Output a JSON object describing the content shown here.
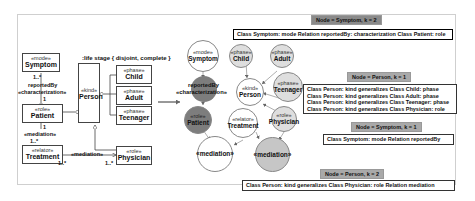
{
  "uml_diagram": {
    "generalization_set_label": ":life stage { disjoint, complete }",
    "classes": [
      {
        "stereotype": "«mode»",
        "name": "Symptom"
      },
      {
        "stereotype": "«role»",
        "name": "Patient"
      },
      {
        "stereotype": "«relator»",
        "name": "Treatment"
      },
      {
        "stereotype": "«kind»",
        "name": "Person"
      },
      {
        "stereotype": "«phase»",
        "name": "Child"
      },
      {
        "stereotype": "«phase»",
        "name": "Adult"
      },
      {
        "stereotype": "«phase»",
        "name": "Teenager"
      },
      {
        "stereotype": "«role»",
        "name": "Physician"
      }
    ],
    "associations": {
      "reported_by": {
        "name": "reportedBy",
        "stereotype": "«characterization»",
        "mult_top": "1..*",
        "mult_bottom": "1"
      },
      "mediation_patient": {
        "stereotype": "«mediation»",
        "mult_top": "1",
        "mult_bottom": "1..*"
      },
      "mediation_physician": {
        "stereotype": "«mediation»",
        "mult_left": "1..*",
        "mult_right": "1..*"
      }
    }
  },
  "graph": {
    "nodes": [
      {
        "id": "symptom",
        "stereotype": "«mode»",
        "name": "Symptom",
        "shade": "white"
      },
      {
        "id": "child",
        "stereotype": "«phase»",
        "name": "Child",
        "shade": "light"
      },
      {
        "id": "adult",
        "stereotype": "«phase»",
        "name": "Adult",
        "shade": "light"
      },
      {
        "id": "person",
        "stereotype": "«kind»",
        "name": "Person",
        "shade": "white"
      },
      {
        "id": "teenager",
        "stereotype": "«phase»",
        "name": "Teenager",
        "shade": "light"
      },
      {
        "id": "reportedby",
        "stereotype": "reportedBy",
        "name": "«characterization»",
        "shade": "dark"
      },
      {
        "id": "patient",
        "stereotype": "«role»",
        "name": "Patient",
        "shade": "dark"
      },
      {
        "id": "treatment",
        "stereotype": "«relator»",
        "name": "Treatment",
        "shade": "white"
      },
      {
        "id": "physician",
        "stereotype": "«role»",
        "name": "Physician",
        "shade": "light"
      },
      {
        "id": "mediation1",
        "stereotype": "",
        "name": "«mediation»",
        "shade": "white"
      },
      {
        "id": "mediation2",
        "stereotype": "",
        "name": "«mediation»",
        "shade": "mid"
      }
    ]
  },
  "panels": [
    {
      "header": "Node = Symptom, k = 2",
      "lines": [
        "Class Symptom: mode Relation reportedBy: characterization Class Patient: role"
      ]
    },
    {
      "header": "Node = Person, k = 1",
      "lines": [
        "Class Person: kind generalizes Class Child: phase",
        "Class Person: kind generalizes Class Adult: phase",
        "Class Person: kind generalizes Class Teenager: phase",
        "Class Person: kind generalizes Class Physician: role"
      ]
    },
    {
      "header": "Node = Symptom, k = 1",
      "lines": [
        "Class Symptom: mode Relation reportedBy"
      ]
    },
    {
      "header": "Node = Person, k = 2",
      "lines": [
        "Class Person: kind generalizes Class Physician: role Relation mediation"
      ]
    }
  ],
  "colors": {
    "dark_node": "#7d7d7d",
    "light_node": "#dedede",
    "mid_node": "#c6c6c6",
    "header": "#a9a9a9"
  }
}
